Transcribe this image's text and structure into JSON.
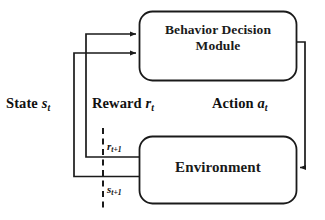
{
  "diagram": {
    "type": "reinforcement-learning-loop",
    "background_color": "#ffffff",
    "stroke_color": "#1a1a1a",
    "nodes": [
      {
        "id": "behavior-decision-module",
        "label_line1": "Behavior Decision",
        "label_line2": "Module",
        "shape": "rounded-rectangle",
        "x": 139,
        "y": 11,
        "width": 158,
        "height": 70
      },
      {
        "id": "environment",
        "label_line1": "Environment",
        "label_line2": "",
        "shape": "rounded-rectangle",
        "x": 139,
        "y": 136,
        "width": 158,
        "height": 68
      }
    ],
    "edges": [
      {
        "id": "reward-edge",
        "label_text": "Reward",
        "label_symbol": "r",
        "label_subscript": "t",
        "from": "environment",
        "to": "behavior-decision-module",
        "direction": "up"
      },
      {
        "id": "state-edge",
        "label_text": "State",
        "label_symbol": "s",
        "label_subscript": "t",
        "from": "environment",
        "to": "behavior-decision-module",
        "direction": "up"
      },
      {
        "id": "action-edge",
        "label_text": "Action",
        "label_symbol": "a",
        "label_subscript": "t",
        "from": "behavior-decision-module",
        "to": "environment",
        "direction": "down"
      }
    ],
    "time_step_labels": [
      {
        "id": "reward-next",
        "symbol": "r",
        "subscript": "t+1"
      },
      {
        "id": "state-next",
        "symbol": "s",
        "subscript": "t+1"
      }
    ],
    "divider": {
      "id": "time-step-divider",
      "style": "dashed-vertical",
      "x": 103,
      "y_start": 128,
      "y_end": 212
    }
  }
}
